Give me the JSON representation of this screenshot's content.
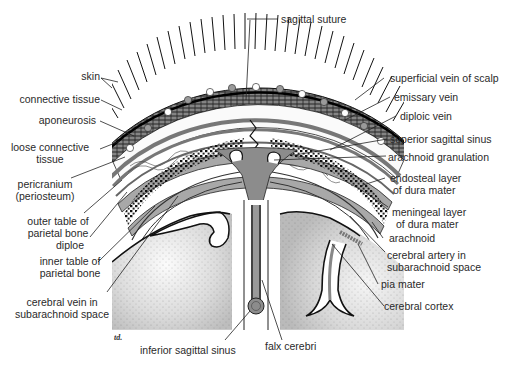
{
  "figure": {
    "signature": "td.",
    "colors": {
      "line": "#1a1a1a",
      "dura_gray": "#9a9a9a",
      "sinus_gray": "#8c8c8c",
      "brain_light": "#f4f4f4",
      "brain_dark": "#b8b8b8",
      "text": "#2a2a2a"
    }
  },
  "labels": {
    "left": [
      {
        "id": "skin",
        "text": "skin"
      },
      {
        "id": "connective_tissue",
        "text": "connective tissue"
      },
      {
        "id": "aponeurosis",
        "text": "aponeurosis"
      },
      {
        "id": "loose_connective_tissue",
        "text": "loose connective",
        "text2": "tissue"
      },
      {
        "id": "pericranium",
        "text": "pericranium",
        "text2": "(periosteum)"
      },
      {
        "id": "outer_table",
        "text": "outer table of",
        "text2": "parietal bone"
      },
      {
        "id": "diploe",
        "text": "diploe"
      },
      {
        "id": "inner_table",
        "text": "inner table of",
        "text2": "parietal bone"
      },
      {
        "id": "cerebral_vein",
        "text": "cerebral vein in",
        "text2": "subarachnoid space"
      }
    ],
    "top": [
      {
        "id": "sagittal_suture",
        "text": "sagittal suture"
      }
    ],
    "right": [
      {
        "id": "superficial_vein",
        "text": "superficial vein of scalp"
      },
      {
        "id": "emissary_vein",
        "text": "emissary vein"
      },
      {
        "id": "diploic_vein",
        "text": "diploic vein"
      },
      {
        "id": "superior_sagittal_sinus",
        "text": "superior sagittal sinus"
      },
      {
        "id": "arachnoid_granulation",
        "text": "arachnoid granulation"
      },
      {
        "id": "endosteal_layer",
        "text": "endosteal layer",
        "text2": "of dura mater"
      },
      {
        "id": "meningeal_layer",
        "text": "meningeal layer",
        "text2": "of dura mater"
      },
      {
        "id": "arachnoid",
        "text": "arachnoid"
      },
      {
        "id": "cerebral_artery",
        "text": "cerebral artery in",
        "text2": "subarachnoid space"
      },
      {
        "id": "pia_mater",
        "text": "pia mater"
      },
      {
        "id": "cerebral_cortex",
        "text": "cerebral cortex"
      }
    ],
    "bottom": [
      {
        "id": "inferior_sagittal_sinus",
        "text": "inferior sagittal sinus"
      },
      {
        "id": "falx_cerebri",
        "text": "falx cerebri"
      }
    ]
  }
}
